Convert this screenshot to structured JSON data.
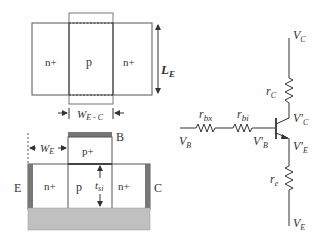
{
  "top_view": {
    "left_region": "n+",
    "center_region": "p",
    "right_region": "n+",
    "length_label": "L",
    "length_sub": "E",
    "width_label": "W",
    "width_sub": "E - C"
  },
  "cross_section": {
    "base_contact": "B",
    "emitter_contact": "E",
    "collector_contact": "C",
    "top_region": "p+",
    "left_region": "n+",
    "center_region": "p",
    "right_region": "n+",
    "thickness_label": "t",
    "thickness_sub": "si",
    "width_label": "W",
    "width_sub": "E",
    "colors": {
      "contact": "#777777",
      "substrate": "#c0c0c0",
      "outline": "#555555"
    }
  },
  "circuit": {
    "vb": {
      "main": "V",
      "sub": "B"
    },
    "rbx": {
      "main": "r",
      "sub": "bx"
    },
    "rbi": {
      "main": "r",
      "sub": "bi"
    },
    "vbp": {
      "main": "V'",
      "sub": "B"
    },
    "rc": {
      "main": "r",
      "sub": "C"
    },
    "vc": {
      "main": "V",
      "sub": "C"
    },
    "vcp": {
      "main": "V'",
      "sub": "C"
    },
    "vep": {
      "main": "V'",
      "sub": "E"
    },
    "re": {
      "main": "r",
      "sub": "e"
    },
    "ve": {
      "main": "V",
      "sub": "E"
    }
  }
}
